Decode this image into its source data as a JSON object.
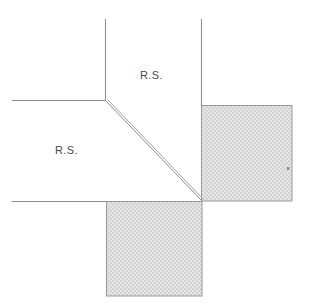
{
  "figure": {
    "type": "technical-line-drawing",
    "width": 309,
    "height": 304,
    "background_color": "#ffffff",
    "line_color": "#8c8c8c",
    "text_color": "#4a4a4a",
    "hatch_fill_color": "#e2e2e2",
    "hatch_dot_color": "#c9c9c9",
    "hatch_border_color": "#9a9a9a"
  },
  "labels": {
    "upper_region": "R.S.",
    "lower_region": "R.S."
  },
  "geometry": {
    "vertical_line_left": {
      "x": 105,
      "y1": 19,
      "y2": 100
    },
    "vertical_line_right": {
      "x": 201,
      "y1": 19,
      "y2": 105
    },
    "horizontal_line_upper": {
      "y": 100,
      "x1": 12,
      "x2": 105
    },
    "horizontal_line_lower": {
      "y": 201,
      "x1": 12,
      "x2": 106
    },
    "diagonal_line": {
      "x1": 105,
      "y1": 100,
      "x2": 202,
      "y2": 201
    },
    "shaded_square_right": {
      "x": 201,
      "y": 105,
      "width": 91,
      "height": 96
    },
    "shaded_square_bottom": {
      "x": 106,
      "y": 201,
      "width": 96,
      "height": 95
    },
    "speck_artifact": {
      "x": 288,
      "y": 168
    }
  }
}
